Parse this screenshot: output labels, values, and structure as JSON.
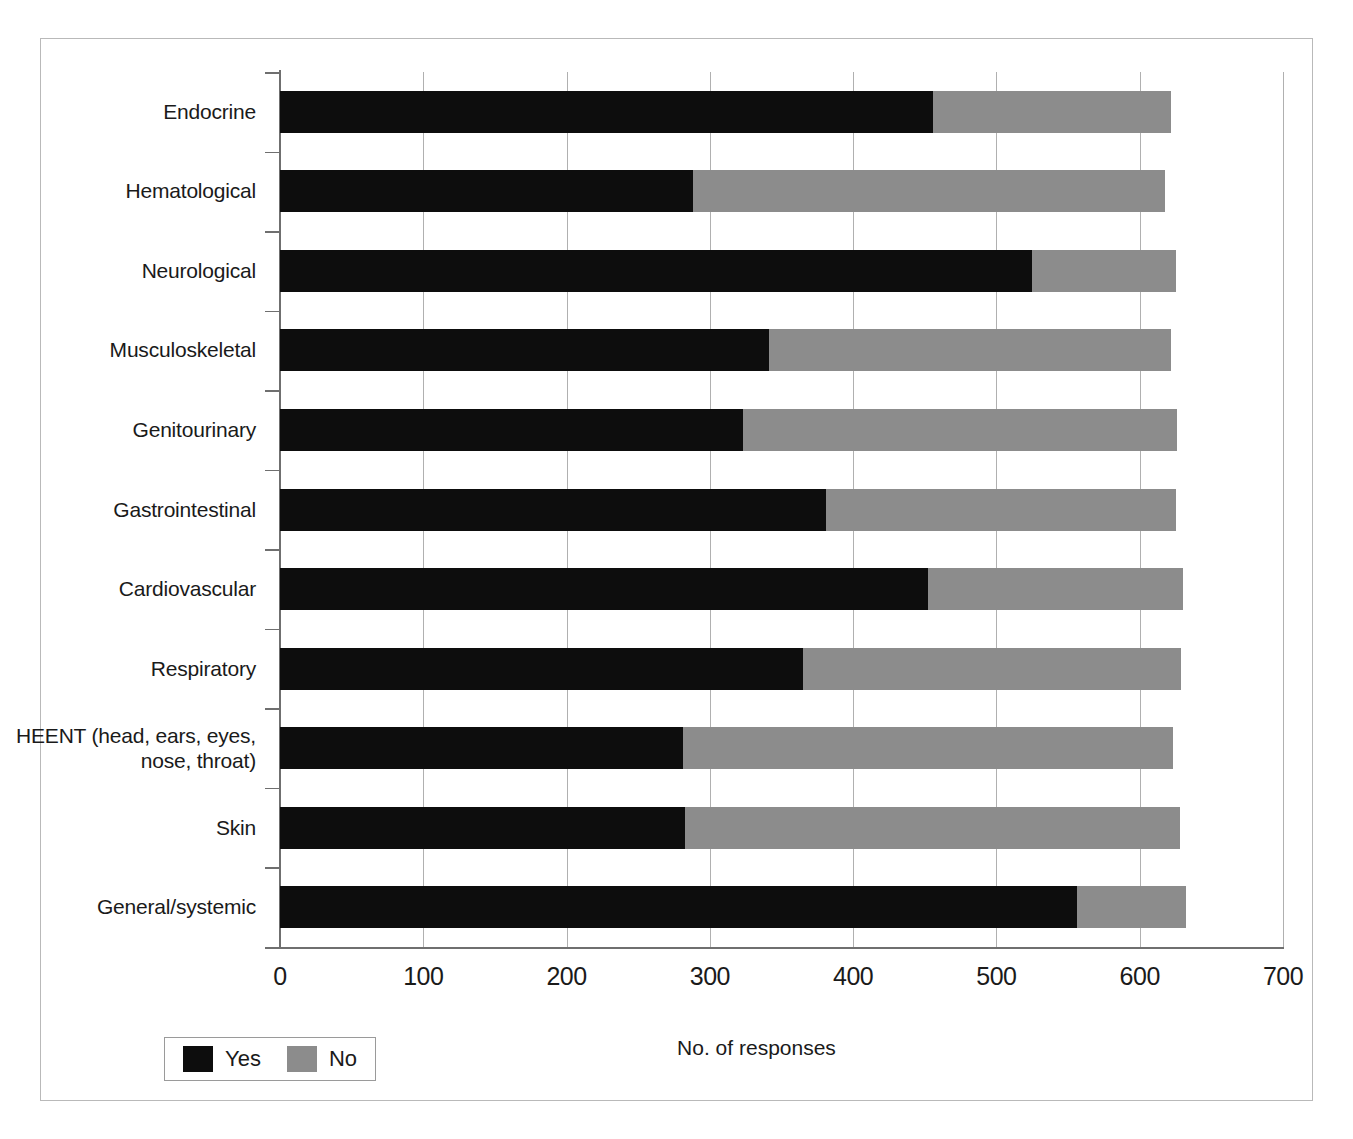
{
  "chart_data": {
    "type": "bar",
    "orientation": "horizontal",
    "stacked": true,
    "title": "",
    "xlabel": "No. of responses",
    "ylabel": "",
    "xlim": [
      0,
      700
    ],
    "xticks": [
      0,
      100,
      200,
      300,
      400,
      500,
      600,
      700
    ],
    "xtick_labels": [
      "0",
      "100",
      "200",
      "300",
      "400",
      "500",
      "600",
      "700"
    ],
    "grid": "vertical",
    "legend_position": "bottom-left",
    "categories": [
      "Endocrine",
      "Hematological",
      "Neurological",
      "Musculoskeletal",
      "Genitourinary",
      "Gastrointestinal",
      "Cardiovascular",
      "Respiratory",
      "HEENT (head, ears, eyes, nose, throat)",
      "Skin",
      "General/systemic"
    ],
    "series": [
      {
        "name": "Yes",
        "color": "#0d0d0d",
        "values": [
          456,
          288,
          525,
          341,
          323,
          381,
          452,
          365,
          281,
          283,
          556
        ]
      },
      {
        "name": "No",
        "color": "#8c8c8c",
        "values": [
          166,
          330,
          100,
          281,
          303,
          244,
          178,
          264,
          342,
          345,
          76
        ]
      }
    ],
    "totals": [
      622,
      618,
      625,
      622,
      626,
      625,
      630,
      629,
      623,
      628,
      632
    ]
  },
  "legend": {
    "items": [
      {
        "label": "Yes",
        "color": "#0d0d0d"
      },
      {
        "label": "No",
        "color": "#8c8c8c"
      }
    ]
  },
  "axis": {
    "x_title": "No. of responses"
  }
}
